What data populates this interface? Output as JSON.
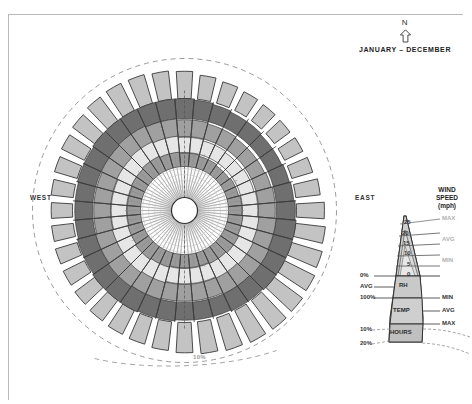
{
  "title_block": {
    "north_letter": "N",
    "north_icon": "north-arrow-icon",
    "period_label": "JANUARY – DECEMBER"
  },
  "cardinals": {
    "west": "WEST",
    "east": "EAST"
  },
  "scale_note": "10%",
  "legend": {
    "title_line1": "WIND",
    "title_line2": "SPEED",
    "title_line3": "(mph)",
    "wind_ticks": [
      "25",
      "20",
      "15",
      "10",
      "5",
      "0"
    ],
    "wind_stats": [
      "MAX",
      "AVG",
      "MIN"
    ],
    "rh": {
      "band": "RH",
      "top": "0%",
      "mid": "AVG",
      "bottom": "100%"
    },
    "temp": {
      "band": "TEMP",
      "min": "MIN",
      "avg": "AVG",
      "max": "MAX"
    },
    "hours": {
      "band": "HOURS",
      "tick1": "10%",
      "tick2": "20%"
    }
  },
  "colors": {
    "hours_block": "#c3c3c3",
    "temp_max": "#6f6f6f",
    "temp_avg": "#a0a0a0",
    "temp_min": "#e6e6e6",
    "rh_outer": "#9a9a9a",
    "rh_inner": "#c9c9c9",
    "wind_spike": "#bdbdbd",
    "stroke": "#3a3a3a",
    "dashed": "#8f8f8f"
  },
  "chart_data": {
    "type": "radar",
    "title": "JANUARY – DECEMBER",
    "sectors": 36,
    "sector_degrees": 10,
    "radial_rings": [
      {
        "name": "HOURS",
        "units": "%",
        "ticks": [
          10,
          20
        ]
      },
      {
        "name": "TEMP",
        "stats": [
          "MIN",
          "AVG",
          "MAX"
        ]
      },
      {
        "name": "RH",
        "units": "%",
        "ticks": [
          0,
          100
        ],
        "stats": [
          "AVG"
        ]
      },
      {
        "name": "WIND SPEED",
        "units": "mph",
        "ticks": [
          0,
          5,
          10,
          15,
          20,
          25
        ],
        "stats": [
          "MIN",
          "AVG",
          "MAX"
        ]
      }
    ],
    "hours_pct": [
      11.5,
      10.2,
      9.4,
      8.8,
      8.4,
      8.2,
      8.6,
      9.2,
      10.4,
      11.8,
      12.6,
      13.4,
      14.2,
      14.8,
      15.2,
      15.0,
      14.4,
      13.6,
      12.8,
      12.2,
      11.6,
      11.2,
      10.8,
      10.4,
      10.0,
      9.6,
      9.2,
      9.0,
      9.4,
      10.0,
      10.8,
      11.6,
      12.4,
      12.8,
      12.6,
      12.0
    ],
    "temp_max": [
      1.0,
      0.99,
      0.98,
      0.97,
      0.97,
      0.96,
      0.96,
      0.97,
      0.98,
      0.99,
      1.0,
      1.0,
      1.0,
      1.0,
      0.99,
      0.99,
      0.98,
      0.98,
      0.98,
      0.99,
      0.99,
      1.0,
      1.0,
      1.0,
      0.99,
      0.99,
      0.98,
      0.98,
      0.98,
      0.99,
      0.99,
      1.0,
      1.0,
      1.0,
      1.0,
      1.0
    ],
    "temp_avg": [
      0.78,
      0.78,
      0.77,
      0.77,
      0.76,
      0.76,
      0.76,
      0.77,
      0.78,
      0.78,
      0.79,
      0.79,
      0.8,
      0.8,
      0.79,
      0.79,
      0.78,
      0.78,
      0.78,
      0.78,
      0.79,
      0.79,
      0.8,
      0.8,
      0.79,
      0.79,
      0.78,
      0.78,
      0.78,
      0.78,
      0.79,
      0.79,
      0.8,
      0.8,
      0.79,
      0.79
    ],
    "temp_min": [
      0.58,
      0.58,
      0.57,
      0.57,
      0.56,
      0.56,
      0.57,
      0.57,
      0.58,
      0.58,
      0.59,
      0.59,
      0.6,
      0.6,
      0.59,
      0.59,
      0.58,
      0.58,
      0.58,
      0.58,
      0.59,
      0.59,
      0.6,
      0.6,
      0.59,
      0.59,
      0.58,
      0.58,
      0.58,
      0.58,
      0.59,
      0.59,
      0.6,
      0.6,
      0.59,
      0.59
    ],
    "rh_outer": [
      0.46,
      0.46,
      0.45,
      0.45,
      0.44,
      0.44,
      0.45,
      0.45,
      0.46,
      0.46,
      0.47,
      0.47,
      0.48,
      0.48,
      0.47,
      0.47,
      0.46,
      0.46,
      0.46,
      0.46,
      0.47,
      0.47,
      0.48,
      0.48,
      0.47,
      0.47,
      0.46,
      0.46,
      0.46,
      0.46,
      0.47,
      0.47,
      0.48,
      0.48,
      0.47,
      0.47
    ],
    "wind_spike": [
      0.3,
      0.22,
      0.31,
      0.2,
      0.33,
      0.21,
      0.29,
      0.23,
      0.32,
      0.19,
      0.3,
      0.24,
      0.34,
      0.2,
      0.28,
      0.22,
      0.31,
      0.21,
      0.33,
      0.23,
      0.29,
      0.2,
      0.32,
      0.24,
      0.3,
      0.21,
      0.34,
      0.22,
      0.28,
      0.23,
      0.31,
      0.2,
      0.33,
      0.21,
      0.29,
      0.24
    ],
    "legend_position": "right",
    "grid": true
  }
}
